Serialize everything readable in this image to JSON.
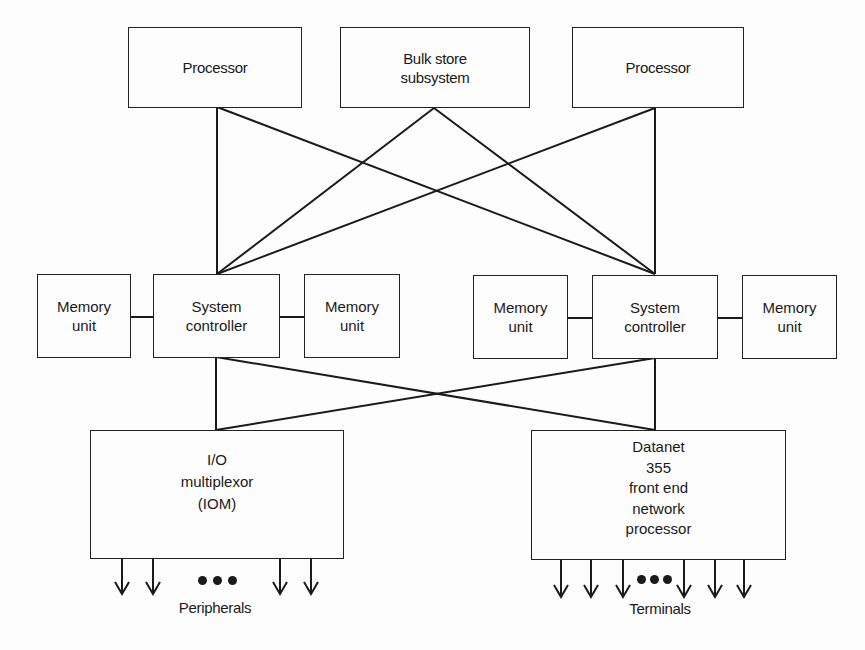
{
  "diagram": {
    "top_row": {
      "processor_left": "Processor",
      "bulk_store": "Bulk store\nsubsystem",
      "processor_right": "Processor"
    },
    "middle_row": {
      "memory_unit_1": "Memory\nunit",
      "system_controller_left": "System\ncontroller",
      "memory_unit_2": "Memory\nunit",
      "memory_unit_3": "Memory\nunit",
      "system_controller_right": "System\ncontroller",
      "memory_unit_4": "Memory\nunit"
    },
    "bottom_row": {
      "iom": "I/O\nmultiplexor\n(IOM)",
      "datanet": "Datanet\n355\nfront end\nnetwork\nprocessor"
    },
    "outputs": {
      "peripherals_label": "Peripherals",
      "terminals_label": "Terminals",
      "peripherals_arrow_count": 4,
      "terminals_arrow_count": 6
    },
    "connections": [
      [
        "Processor (left)",
        "System controller (left)"
      ],
      [
        "Processor (left)",
        "System controller (right)"
      ],
      [
        "Bulk store subsystem",
        "System controller (left)"
      ],
      [
        "Bulk store subsystem",
        "System controller (right)"
      ],
      [
        "Processor (right)",
        "System controller (left)"
      ],
      [
        "Processor (right)",
        "System controller (right)"
      ],
      [
        "Memory unit 1",
        "System controller (left)"
      ],
      [
        "System controller (left)",
        "Memory unit 2"
      ],
      [
        "Memory unit 3",
        "System controller (right)"
      ],
      [
        "System controller (right)",
        "Memory unit 4"
      ],
      [
        "System controller (left)",
        "I/O multiplexor (IOM)"
      ],
      [
        "System controller (left)",
        "Datanet 355"
      ],
      [
        "System controller (right)",
        "I/O multiplexor (IOM)"
      ],
      [
        "System controller (right)",
        "Datanet 355"
      ]
    ]
  }
}
